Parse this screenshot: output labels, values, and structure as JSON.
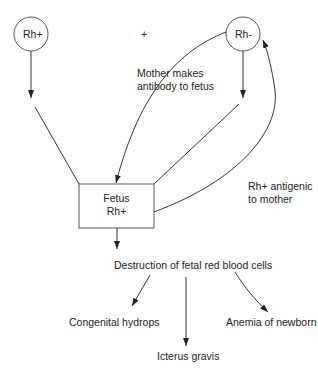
{
  "diagram": {
    "nodes": {
      "father": "Rh+",
      "plus": "+",
      "mother": "Rh-",
      "fetus_line1": "Fetus",
      "fetus_line2": "Rh+"
    },
    "annotations": {
      "antibody_line1": "Mother makes",
      "antibody_line2": "antibody to fetus",
      "antigenic_line1": "Rh+ antigenic",
      "antigenic_line2": "to mother"
    },
    "outcome": "Destruction of fetal red blood cells",
    "consequences": [
      "Congenital hydrops",
      "Icterus gravis",
      "Anemia of newborn"
    ],
    "colors": {
      "line": "#333333",
      "background": "#ffffff"
    }
  }
}
